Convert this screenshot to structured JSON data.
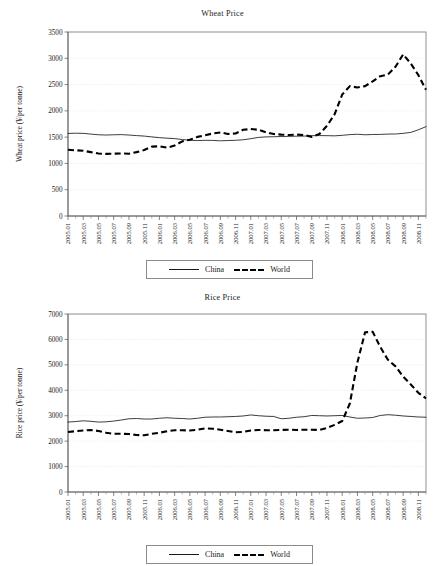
{
  "clipped_header_text": "",
  "legend": {
    "china_label": "China",
    "world_label": "World"
  },
  "chart_data": [
    {
      "type": "line",
      "id": "wheat",
      "title": "Wheat Price",
      "xlabel": "",
      "ylabel": "Wheat price (¥/per tonne)",
      "ylim": [
        0,
        3500
      ],
      "ytick_step": 500,
      "yticks": [
        0,
        500,
        1000,
        1500,
        2000,
        2500,
        3000,
        3500
      ],
      "grid": true,
      "legend_position": "bottom",
      "x": [
        "2005.01",
        "2005.02",
        "2005.03",
        "2005.04",
        "2005.05",
        "2005.06",
        "2005.07",
        "2005.08",
        "2005.09",
        "2005.10",
        "2005.11",
        "2005.12",
        "2006.01",
        "2006.02",
        "2006.03",
        "2006.04",
        "2006.05",
        "2006.06",
        "2006.07",
        "2006.08",
        "2006.09",
        "2006.10",
        "2006.11",
        "2006.12",
        "2007.01",
        "2007.02",
        "2007.03",
        "2007.04",
        "2007.05",
        "2007.06",
        "2007.07",
        "2007.08",
        "2007.09",
        "2007.10",
        "2007.11",
        "2007.12",
        "2008.01",
        "2008.02",
        "2008.03",
        "2008.04",
        "2008.05",
        "2008.06",
        "2008.07",
        "2008.08",
        "2008.09",
        "2008.10",
        "2008.11",
        "2008.12"
      ],
      "xtick_labels": [
        "2005.01",
        "2005.03",
        "2005.05",
        "2005.07",
        "2005.09",
        "2005.11",
        "2006.01",
        "2006.03",
        "2006.05",
        "2006.07",
        "2006.09",
        "2006.11",
        "2007.01",
        "2007.03",
        "2007.05",
        "2007.07",
        "2007.09",
        "2007.11",
        "2008.01",
        "2008.03",
        "2008.05",
        "2008.07",
        "2008.09",
        "2008.11"
      ],
      "series": [
        {
          "name": "China",
          "style": "solid",
          "values": [
            1570,
            1575,
            1572,
            1558,
            1545,
            1540,
            1545,
            1548,
            1540,
            1530,
            1520,
            1505,
            1490,
            1480,
            1472,
            1455,
            1440,
            1435,
            1440,
            1438,
            1430,
            1435,
            1440,
            1450,
            1470,
            1495,
            1505,
            1508,
            1512,
            1515,
            1518,
            1520,
            1528,
            1530,
            1528,
            1525,
            1535,
            1548,
            1555,
            1545,
            1550,
            1552,
            1558,
            1560,
            1572,
            1590,
            1640,
            1700
          ]
        },
        {
          "name": "World",
          "style": "dashed",
          "values": [
            1260,
            1250,
            1242,
            1215,
            1188,
            1182,
            1185,
            1190,
            1185,
            1215,
            1255,
            1320,
            1325,
            1300,
            1340,
            1420,
            1450,
            1505,
            1535,
            1570,
            1590,
            1560,
            1570,
            1640,
            1655,
            1640,
            1590,
            1560,
            1548,
            1540,
            1548,
            1540,
            1505,
            1560,
            1715,
            1935,
            2310,
            2470,
            2445,
            2470,
            2560,
            2660,
            2690,
            2840,
            3075,
            2900,
            2680,
            2400
          ]
        }
      ]
    },
    {
      "type": "line",
      "id": "rice",
      "title": "Rice Price",
      "xlabel": "",
      "ylabel": "Rice price (¥/per tonne)",
      "ylim": [
        0,
        7000
      ],
      "ytick_step": 1000,
      "yticks": [
        0,
        1000,
        2000,
        3000,
        4000,
        5000,
        6000,
        7000
      ],
      "grid": true,
      "legend_position": "bottom",
      "x": [
        "2005.01",
        "2005.02",
        "2005.03",
        "2005.04",
        "2005.05",
        "2005.06",
        "2005.07",
        "2005.08",
        "2005.09",
        "2005.10",
        "2005.11",
        "2005.12",
        "2006.01",
        "2006.02",
        "2006.03",
        "2006.04",
        "2006.05",
        "2006.06",
        "2006.07",
        "2006.08",
        "2006.09",
        "2006.10",
        "2006.11",
        "2006.12",
        "2007.01",
        "2007.02",
        "2007.03",
        "2007.04",
        "2007.05",
        "2007.06",
        "2007.07",
        "2007.08",
        "2007.09",
        "2007.10",
        "2007.11",
        "2007.12",
        "2008.01",
        "2008.02",
        "2008.03",
        "2008.04",
        "2008.05",
        "2008.06",
        "2008.07",
        "2008.08",
        "2008.09",
        "2008.10",
        "2008.11",
        "2008.12"
      ],
      "xtick_labels": [
        "2005.01",
        "2005.03",
        "2005.05",
        "2005.07",
        "2005.09",
        "2005.11",
        "2006.01",
        "2006.03",
        "2006.05",
        "2006.07",
        "2006.09",
        "2006.11",
        "2007.01",
        "2007.03",
        "2007.05",
        "2007.07",
        "2007.09",
        "2007.11",
        "2008.01",
        "2008.03",
        "2008.05",
        "2008.07",
        "2008.09",
        "2008.11"
      ],
      "series": [
        {
          "name": "China",
          "style": "solid",
          "values": [
            2750,
            2770,
            2800,
            2780,
            2750,
            2760,
            2790,
            2830,
            2880,
            2890,
            2870,
            2870,
            2900,
            2920,
            2900,
            2890,
            2870,
            2900,
            2940,
            2950,
            2950,
            2960,
            2970,
            2990,
            3030,
            3000,
            2980,
            2970,
            2880,
            2900,
            2940,
            2960,
            3010,
            3000,
            2990,
            3000,
            3010,
            2950,
            2900,
            2910,
            2930,
            3010,
            3040,
            3020,
            2990,
            2970,
            2950,
            2940
          ],
          "note": "relatively flat around 2800-3000"
        },
        {
          "name": "World",
          "style": "dashed",
          "values": [
            2360,
            2390,
            2420,
            2440,
            2400,
            2330,
            2290,
            2290,
            2280,
            2240,
            2230,
            2290,
            2330,
            2390,
            2430,
            2430,
            2420,
            2450,
            2500,
            2490,
            2450,
            2400,
            2350,
            2360,
            2420,
            2440,
            2430,
            2430,
            2440,
            2450,
            2440,
            2450,
            2450,
            2440,
            2520,
            2640,
            2790,
            3480,
            5100,
            6280,
            6300,
            5700,
            5200,
            4940,
            4540,
            4230,
            3900,
            3680
          ],
          "note": "sharp spike peaking ~6300 in 2008.04-2008.05"
        }
      ]
    }
  ]
}
